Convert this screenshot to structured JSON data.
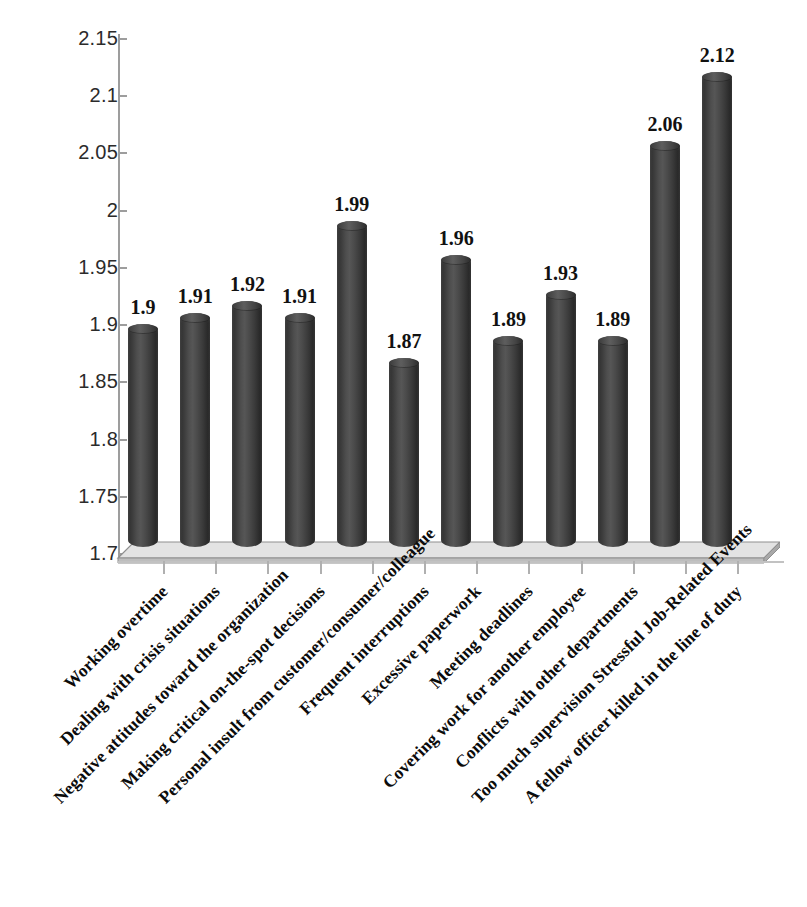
{
  "chart_data": {
    "type": "bar",
    "title": "",
    "subtitle": "",
    "xlabel": "",
    "ylabel": "",
    "ylim": [
      1.7,
      2.15
    ],
    "y_tick_step": 0.05,
    "grid": false,
    "legend": null,
    "legend_position": "none",
    "orientation": "vertical",
    "bar_style": "3d-cylinder",
    "bar_color": "#3d3d3d",
    "floor_color": "#d9d9d9",
    "axis_color": "#9d9d9d",
    "value_label_color": "#111111",
    "categories": [
      "Working overtime",
      "Dealing with crisis situations",
      "Negative attitudes toward the organization",
      "Making critical on-the-spot decisions",
      "Personal insult from customer/consumer/colleague",
      "Frequent interruptions",
      "Excessive paperwork",
      "Meeting deadlines",
      "Covering work for another employee",
      "Conflicts with other departments",
      "Too much supervision Stressful Job-Related Events",
      "A fellow officer killed in the line of duty"
    ],
    "values": [
      1.9,
      1.91,
      1.92,
      1.91,
      1.99,
      1.87,
      1.96,
      1.89,
      1.93,
      1.89,
      2.06,
      2.12
    ],
    "value_labels": [
      "1.9",
      "1.91",
      "1.92",
      "1.91",
      "1.99",
      "1.87",
      "1.96",
      "1.89",
      "1.93",
      "1.89",
      "2.06",
      "2.12"
    ],
    "y_ticks": [
      2.15,
      2.1,
      2.05,
      2,
      1.95,
      1.9,
      1.85,
      1.8,
      1.75,
      1.7
    ],
    "y_tick_labels": [
      "2.15",
      "2.1",
      "2.05",
      "2",
      "1.95",
      "1.9",
      "1.85",
      "1.8",
      "1.75",
      "1.7"
    ]
  }
}
